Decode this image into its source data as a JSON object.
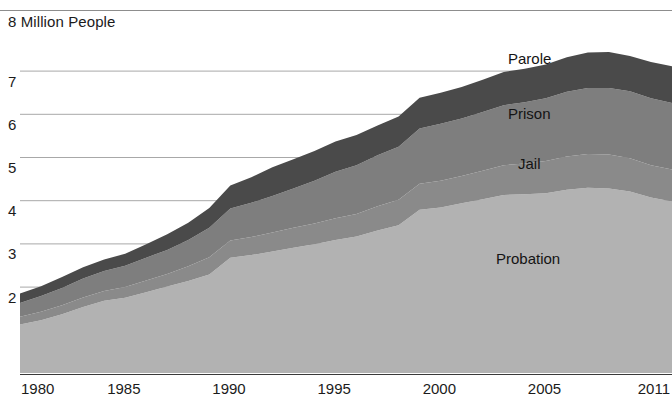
{
  "chart": {
    "title": "8 Million People",
    "y_axis": {
      "ticks": [
        "8",
        "7",
        "6",
        "5",
        "4",
        "3",
        "2"
      ]
    },
    "x_axis": {
      "ticks": [
        "1980",
        "1985",
        "1990",
        "1995",
        "2000",
        "2005",
        "2011"
      ]
    },
    "series_labels": {
      "parole": "Parole",
      "prison": "Prison",
      "jail": "Jail",
      "probation": "Probation"
    },
    "colors": {
      "parole": "#4a4a4a",
      "prison": "#7e7e7e",
      "jail": "#8a8a8a",
      "probation": "#b2b2b2",
      "gridline": "#a8a8a8",
      "axis": "#3a3a3a",
      "text": "#1b1b1b",
      "background": "#ffffff"
    }
  },
  "chart_data": {
    "type": "area",
    "title": "8 Million People",
    "xlabel": "",
    "ylabel": "Million People",
    "xlim": [
      1980,
      2011
    ],
    "ylim": [
      0,
      8
    ],
    "grid": true,
    "stacked": true,
    "legend": "inline-labels",
    "x": [
      1980,
      1981,
      1982,
      1983,
      1984,
      1985,
      1986,
      1987,
      1988,
      1989,
      1990,
      1991,
      1992,
      1993,
      1994,
      1995,
      1996,
      1997,
      1998,
      1999,
      2000,
      2001,
      2002,
      2003,
      2004,
      2005,
      2006,
      2007,
      2008,
      2009,
      2010,
      2011
    ],
    "series": [
      {
        "name": "Probation",
        "values": [
          1.12,
          1.22,
          1.36,
          1.53,
          1.67,
          1.74,
          1.87,
          2.0,
          2.13,
          2.28,
          2.67,
          2.73,
          2.81,
          2.9,
          2.98,
          3.08,
          3.16,
          3.3,
          3.42,
          3.78,
          3.83,
          3.93,
          4.02,
          4.12,
          4.14,
          4.16,
          4.24,
          4.29,
          4.27,
          4.2,
          4.06,
          3.97
        ]
      },
      {
        "name": "Jail",
        "values": [
          0.18,
          0.2,
          0.21,
          0.22,
          0.23,
          0.25,
          0.27,
          0.29,
          0.34,
          0.4,
          0.4,
          0.42,
          0.44,
          0.46,
          0.48,
          0.5,
          0.52,
          0.56,
          0.59,
          0.6,
          0.62,
          0.63,
          0.66,
          0.69,
          0.71,
          0.75,
          0.77,
          0.78,
          0.79,
          0.77,
          0.75,
          0.74
        ]
      },
      {
        "name": "Prison",
        "values": [
          0.32,
          0.36,
          0.4,
          0.44,
          0.46,
          0.49,
          0.53,
          0.56,
          0.61,
          0.68,
          0.74,
          0.79,
          0.85,
          0.91,
          0.99,
          1.08,
          1.13,
          1.18,
          1.23,
          1.28,
          1.32,
          1.33,
          1.36,
          1.39,
          1.42,
          1.45,
          1.5,
          1.53,
          1.54,
          1.55,
          1.55,
          1.54
        ]
      },
      {
        "name": "Parole",
        "values": [
          0.22,
          0.23,
          0.25,
          0.26,
          0.27,
          0.28,
          0.31,
          0.36,
          0.4,
          0.46,
          0.53,
          0.59,
          0.66,
          0.68,
          0.69,
          0.7,
          0.7,
          0.69,
          0.7,
          0.71,
          0.72,
          0.73,
          0.75,
          0.77,
          0.77,
          0.78,
          0.8,
          0.82,
          0.83,
          0.82,
          0.84,
          0.85
        ]
      }
    ],
    "totals": [
      1.84,
      2.01,
      2.22,
      2.45,
      2.63,
      2.76,
      2.98,
      3.21,
      3.48,
      3.82,
      4.34,
      4.53,
      4.76,
      4.95,
      5.14,
      5.36,
      5.51,
      5.73,
      5.94,
      6.37,
      6.49,
      6.62,
      6.79,
      6.97,
      7.04,
      7.14,
      7.31,
      7.42,
      7.43,
      7.34,
      7.2,
      7.1
    ]
  }
}
